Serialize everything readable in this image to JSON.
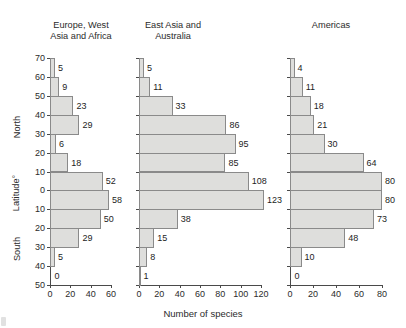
{
  "chart_data": {
    "type": "bar",
    "orientation": "horizontal",
    "title": "",
    "xlabel": "Number of species",
    "ylabel": "Latitude°",
    "y_direction_labels": [
      "North",
      "South"
    ],
    "grid": false,
    "legend": "none",
    "categories": [
      "70-60 N",
      "60-50 N",
      "50-40 N",
      "40-30 N",
      "30-20 N",
      "20-10 N",
      "10-0 N",
      "0-10 S",
      "10-20 S",
      "20-30 S",
      "30-40 S",
      "40-50 S"
    ],
    "y_tick_labels": [
      "70",
      "60",
      "50",
      "40",
      "30",
      "20",
      "10",
      "0",
      "10",
      "20",
      "30",
      "40",
      "50"
    ],
    "panels": [
      {
        "name": "europe-west-asia-africa",
        "title": "Europe, West\nAsia and Africa",
        "xlim": [
          0,
          60
        ],
        "x_tick_labels": [
          "0",
          "20",
          "40",
          "60"
        ],
        "x_ticks": [
          0,
          20,
          40,
          60
        ],
        "values": [
          5,
          9,
          23,
          29,
          6,
          18,
          52,
          58,
          50,
          29,
          5,
          0
        ]
      },
      {
        "name": "east-asia-australia",
        "title": "East Asia and\nAustralia",
        "xlim": [
          0,
          120
        ],
        "x_tick_labels": [
          "0",
          "20",
          "40",
          "60",
          "80",
          "100",
          "120"
        ],
        "x_ticks": [
          0,
          20,
          40,
          60,
          80,
          100,
          120
        ],
        "values": [
          5,
          11,
          33,
          86,
          95,
          85,
          108,
          123,
          38,
          15,
          8,
          1
        ]
      },
      {
        "name": "americas",
        "title": "Americas",
        "xlim": [
          0,
          80
        ],
        "x_tick_labels": [
          "0",
          "20",
          "40",
          "60",
          "80"
        ],
        "x_ticks": [
          0,
          20,
          40,
          60,
          80
        ],
        "values": [
          4,
          11,
          18,
          21,
          30,
          64,
          80,
          80,
          73,
          48,
          10,
          0
        ]
      }
    ]
  },
  "axis": {
    "ylabel": "Latitude°",
    "north_label": "North",
    "south_label": "South",
    "xlabel": "Number of species"
  }
}
